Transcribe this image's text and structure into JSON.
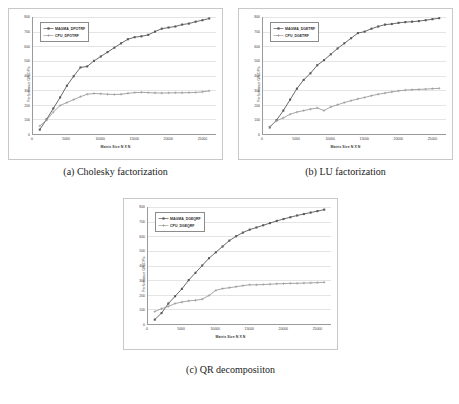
{
  "figure": {
    "panels": [
      {
        "id": "panel-a",
        "caption": "(a) Cholesky factorization",
        "chart_data": {
          "type": "line",
          "title": "",
          "xlabel": "Matrix Size N X N",
          "ylabel": "Performance GFLOP/s",
          "xlim": [
            0,
            27000
          ],
          "ylim": [
            0,
            800
          ],
          "xticks": [
            0,
            5000,
            10000,
            15000,
            20000,
            25000
          ],
          "xtick_labels": [
            "0",
            "5000",
            "10000",
            "15000",
            "20000",
            "25000"
          ],
          "yticks": [
            0,
            100,
            200,
            300,
            400,
            500,
            600,
            700,
            800
          ],
          "ytick_labels": [
            "0",
            "100",
            "200",
            "300",
            "400",
            "500",
            "600",
            "700",
            "800"
          ],
          "grid": true,
          "legend_position": "upper-left",
          "x": [
            1000,
            2000,
            3000,
            4000,
            5000,
            6000,
            7000,
            8000,
            9000,
            10000,
            11000,
            12000,
            13000,
            14000,
            15000,
            16000,
            17000,
            18000,
            19000,
            20000,
            21000,
            22000,
            23000,
            24000,
            25000,
            26000
          ],
          "series": [
            {
              "name": "MAGMA_DPOTRF",
              "marker": "square",
              "color": "#595959",
              "values": [
                30,
                100,
                175,
                250,
                330,
                395,
                455,
                462,
                500,
                530,
                560,
                590,
                620,
                648,
                662,
                668,
                678,
                700,
                720,
                728,
                735,
                748,
                755,
                768,
                778,
                790
              ]
            },
            {
              "name": "CPU_DPOTRF",
              "marker": "plus",
              "color": "#9c9c9c",
              "values": [
                55,
                95,
                150,
                195,
                215,
                235,
                255,
                272,
                277,
                275,
                272,
                270,
                272,
                278,
                283,
                285,
                283,
                281,
                280,
                281,
                282,
                282,
                283,
                284,
                288,
                295
              ]
            }
          ]
        }
      },
      {
        "id": "panel-b",
        "caption": "(b) LU factorization",
        "chart_data": {
          "type": "line",
          "title": "",
          "xlabel": "Matrix Size N X N",
          "ylabel": "Performance GFLOP/s",
          "xlim": [
            0,
            27000
          ],
          "ylim": [
            0,
            800
          ],
          "xticks": [
            0,
            5000,
            10000,
            15000,
            20000,
            25000
          ],
          "xtick_labels": [
            "0",
            "5000",
            "10000",
            "15000",
            "20000",
            "25000"
          ],
          "yticks": [
            0,
            100,
            200,
            300,
            400,
            500,
            600,
            700,
            800
          ],
          "ytick_labels": [
            "0",
            "100",
            "200",
            "300",
            "400",
            "500",
            "600",
            "700",
            "800"
          ],
          "grid": true,
          "legend_position": "upper-left",
          "x": [
            1000,
            2000,
            3000,
            4000,
            5000,
            6000,
            7000,
            8000,
            9000,
            10000,
            11000,
            12000,
            13000,
            14000,
            15000,
            16000,
            17000,
            18000,
            19000,
            20000,
            21000,
            22000,
            23000,
            24000,
            25000,
            26000
          ],
          "series": [
            {
              "name": "MAGMA_DGETRF",
              "marker": "square",
              "color": "#595959",
              "values": [
                45,
                95,
                160,
                235,
                310,
                370,
                415,
                470,
                505,
                545,
                585,
                620,
                655,
                690,
                700,
                720,
                735,
                748,
                752,
                760,
                765,
                768,
                772,
                778,
                785,
                792
              ]
            },
            {
              "name": "CPU_DGETRF",
              "marker": "plus",
              "color": "#9c9c9c",
              "values": [
                50,
                90,
                110,
                135,
                150,
                160,
                170,
                178,
                160,
                185,
                200,
                215,
                228,
                240,
                250,
                262,
                272,
                280,
                288,
                295,
                300,
                303,
                305,
                307,
                310,
                312
              ]
            }
          ]
        }
      },
      {
        "id": "panel-c",
        "caption": "(c) QR decomposiiton",
        "chart_data": {
          "type": "line",
          "title": "",
          "xlabel": "Matrix Size N X N",
          "ylabel": "Performance GFLOP/s",
          "xlim": [
            0,
            27000
          ],
          "ylim": [
            0,
            800
          ],
          "xticks": [
            0,
            5000,
            10000,
            15000,
            20000,
            25000
          ],
          "xtick_labels": [
            "0",
            "5000",
            "10000",
            "15000",
            "20000",
            "25000"
          ],
          "yticks": [
            0,
            100,
            200,
            300,
            400,
            500,
            600,
            700,
            800
          ],
          "ytick_labels": [
            "0",
            "100",
            "200",
            "300",
            "400",
            "500",
            "600",
            "700",
            "800"
          ],
          "grid": true,
          "legend_position": "upper-left",
          "x": [
            1000,
            2000,
            3000,
            4000,
            5000,
            6000,
            7000,
            8000,
            9000,
            10000,
            11000,
            12000,
            13000,
            14000,
            15000,
            16000,
            17000,
            18000,
            19000,
            20000,
            21000,
            22000,
            23000,
            24000,
            25000,
            26000
          ],
          "series": [
            {
              "name": "MAGMA_DGEQRF",
              "marker": "square",
              "color": "#595959",
              "values": [
                30,
                75,
                140,
                190,
                240,
                300,
                350,
                400,
                450,
                490,
                530,
                570,
                600,
                625,
                645,
                660,
                675,
                690,
                705,
                718,
                730,
                742,
                752,
                762,
                772,
                782
              ]
            },
            {
              "name": "CPU_DGEQRF",
              "marker": "plus",
              "color": "#9c9c9c",
              "values": [
                85,
                105,
                120,
                140,
                150,
                158,
                162,
                170,
                195,
                230,
                242,
                248,
                255,
                262,
                268,
                268,
                270,
                272,
                275,
                276,
                278,
                278,
                280,
                281,
                283,
                285
              ]
            }
          ]
        }
      }
    ]
  }
}
